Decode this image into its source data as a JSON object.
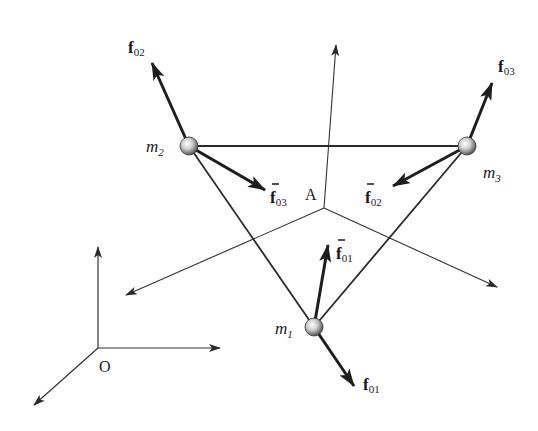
{
  "diagram": {
    "title": "",
    "points": {
      "origin": "O",
      "center": "A"
    },
    "masses": [
      {
        "id": "m1",
        "label": "m",
        "sub": "1"
      },
      {
        "id": "m2",
        "label": "m",
        "sub": "2"
      },
      {
        "id": "m3",
        "label": "m",
        "sub": "3"
      }
    ],
    "forces": [
      {
        "id": "f01",
        "label": "f",
        "sub": "01",
        "bar": false
      },
      {
        "id": "f02",
        "label": "f",
        "sub": "02",
        "bar": false
      },
      {
        "id": "f03",
        "label": "f",
        "sub": "03",
        "bar": false
      },
      {
        "id": "fbar01",
        "label": "f",
        "sub": "01",
        "bar": true
      },
      {
        "id": "fbar02",
        "label": "f",
        "sub": "02",
        "bar": true
      },
      {
        "id": "fbar03",
        "label": "f",
        "sub": "03",
        "bar": true
      }
    ],
    "colors": {
      "line": "#2a2a2a",
      "thin": "#333333",
      "mass_light": "#f2f2f2",
      "mass_dark": "#555555"
    }
  }
}
